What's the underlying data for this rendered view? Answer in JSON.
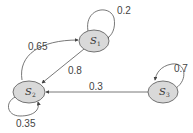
{
  "diagram": {
    "type": "state-transition",
    "colors": {
      "node_fill": "#d9d9d9",
      "node_stroke": "#555555",
      "edge": "#555555",
      "background": "#ffffff"
    },
    "nodes": [
      {
        "id": "S1",
        "label": "S",
        "sub": "1"
      },
      {
        "id": "S2",
        "label": "S",
        "sub": "2"
      },
      {
        "id": "S3",
        "label": "S",
        "sub": "3"
      }
    ],
    "edges": [
      {
        "from": "S1",
        "to": "S1",
        "label": "0.2"
      },
      {
        "from": "S2",
        "to": "S1",
        "label": "0.65"
      },
      {
        "from": "S1",
        "to": "S2",
        "label": "0.8"
      },
      {
        "from": "S3",
        "to": "S2",
        "label": "0.3"
      },
      {
        "from": "S3",
        "to": "S3",
        "label": "0.7"
      },
      {
        "from": "S2",
        "to": "S2",
        "label": "0.35"
      }
    ]
  }
}
